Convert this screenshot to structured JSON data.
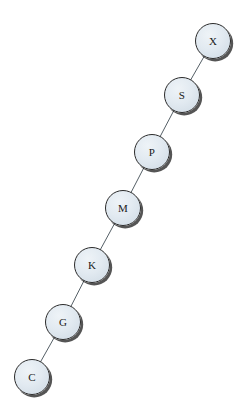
{
  "diagram": {
    "type": "graph",
    "title": "",
    "background_color": "#ffffff",
    "canvas": {
      "width": 244,
      "height": 413
    },
    "node_style": {
      "shape": "circle",
      "radius": 18,
      "fill_color": "#dde6ee",
      "border_color": "#2b2b2b",
      "shadow_color": "#141414",
      "label_color": "#1a1a1a"
    },
    "edge_style": {
      "stroke_color": "#555f66",
      "stroke_width": 1
    },
    "nodes": [
      {
        "id": "C",
        "label": "C",
        "cx": 32,
        "cy": 377,
        "r": 18
      },
      {
        "id": "G",
        "label": "G",
        "cx": 63,
        "cy": 322,
        "r": 18
      },
      {
        "id": "K",
        "label": "K",
        "cx": 92,
        "cy": 265,
        "r": 18
      },
      {
        "id": "M",
        "label": "M",
        "cx": 123,
        "cy": 208,
        "r": 18
      },
      {
        "id": "P",
        "label": "P",
        "cx": 152,
        "cy": 152,
        "r": 18
      },
      {
        "id": "S",
        "label": "S",
        "cx": 182,
        "cy": 95,
        "r": 18
      },
      {
        "id": "X",
        "label": "X",
        "cx": 213,
        "cy": 41,
        "r": 18
      }
    ],
    "edges": [
      {
        "from": "C",
        "to": "G",
        "x1": 32,
        "y1": 377,
        "x2": 63,
        "y2": 322
      },
      {
        "from": "G",
        "to": "K",
        "x1": 63,
        "y1": 322,
        "x2": 92,
        "y2": 265
      },
      {
        "from": "K",
        "to": "M",
        "x1": 92,
        "y1": 265,
        "x2": 123,
        "y2": 208
      },
      {
        "from": "M",
        "to": "P",
        "x1": 123,
        "y1": 208,
        "x2": 152,
        "y2": 152
      },
      {
        "from": "P",
        "to": "S",
        "x1": 152,
        "y1": 152,
        "x2": 182,
        "y2": 95
      },
      {
        "from": "S",
        "to": "X",
        "x1": 182,
        "y1": 95,
        "x2": 213,
        "y2": 41
      }
    ]
  }
}
